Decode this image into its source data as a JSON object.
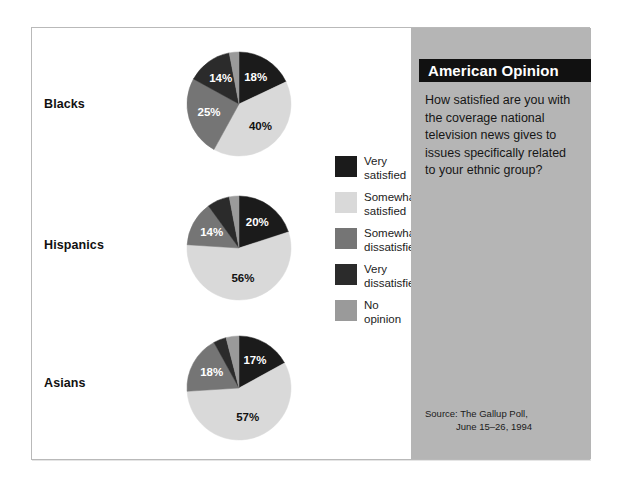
{
  "panel": {
    "title": "American Opinion",
    "question": "How satisfied are you with the coverage national television news gives to issues specifically related to your ethnic group?",
    "source_line1": "Source: The Gallup Poll,",
    "source_line2": "June 15–26, 1994"
  },
  "legend": {
    "items": [
      {
        "label": "Very\nsatisfied",
        "color": "#1b1b1b"
      },
      {
        "label": "Somewhat\nsatisfied",
        "color": "#d9d9d9"
      },
      {
        "label": "Somewhat\ndissatisfied",
        "color": "#757575"
      },
      {
        "label": "Very\ndissatisfied",
        "color": "#2b2b2b"
      },
      {
        "label": "No\nopinion",
        "color": "#9a9a9a"
      }
    ]
  },
  "chart_data": {
    "type": "pie",
    "title": "American Opinion",
    "subtitle": "How satisfied are you with the coverage national television news gives to issues specifically related to your ethnic group?",
    "source": "The Gallup Poll, June 15–26, 1994",
    "categories": [
      "Very satisfied",
      "Somewhat satisfied",
      "Somewhat dissatisfied",
      "Very dissatisfied",
      "No opinion"
    ],
    "colors": [
      "#1b1b1b",
      "#d9d9d9",
      "#757575",
      "#2b2b2b",
      "#9a9a9a"
    ],
    "series": [
      {
        "name": "Blacks",
        "values": [
          18,
          40,
          25,
          14,
          3
        ],
        "labels": [
          "18%",
          "40%",
          "25%",
          "14%",
          "3%"
        ]
      },
      {
        "name": "Hispanics",
        "values": [
          20,
          56,
          14,
          7,
          3
        ],
        "labels": [
          "20%",
          "56%",
          "14%",
          "7%",
          "3%"
        ]
      },
      {
        "name": "Asians",
        "values": [
          17,
          57,
          18,
          4,
          4
        ],
        "labels": [
          "17%",
          "57%",
          "18%",
          "4%",
          "4%"
        ]
      }
    ],
    "legend_position": "center",
    "grid": false
  }
}
